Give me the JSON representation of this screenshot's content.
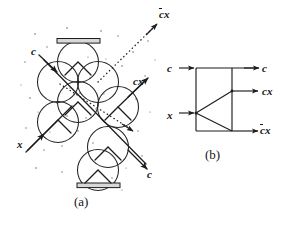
{
  "figure": {
    "background_color": "#ffffff",
    "ink_color": "#141414",
    "panels": [
      {
        "id": "a",
        "caption": "(a)",
        "description": "billiard-ball-model circle lattice with mirrors",
        "labels": {
          "input_c": "c",
          "input_x": "x",
          "output_cbarx": "cx",
          "output_cbarx_overbar": "c",
          "output_cx": "cx",
          "output_c": "c"
        }
      },
      {
        "id": "b",
        "caption": "(b)",
        "description": "interaction gate logic symbol",
        "labels": {
          "input_c": "c",
          "input_x": "x",
          "output_c": "c",
          "output_cx": "cx",
          "output_cbarx_overbar": "c",
          "output_cbarx_rest": "x"
        }
      }
    ]
  },
  "panel_a": {
    "caption": "(a)",
    "label_c_in": "c",
    "label_x_in": "x",
    "label_cbarx_bar": "c",
    "label_cbarx_rest": "x",
    "label_cx": "cx",
    "label_c_out": "c"
  },
  "panel_b": {
    "caption": "(b)",
    "label_c_in": "c",
    "label_x_in": "x",
    "label_c_out": "c",
    "label_cx_out": "cx",
    "label_cbarx_bar": "c",
    "label_cbarx_rest": "x"
  },
  "colors": {
    "ink": "#141414",
    "line": "#2a2a2a",
    "dot": "#555555",
    "mirror_fill": "#d9d9d9",
    "background": "#ffffff"
  },
  "geometry": {
    "circle_radius": 20,
    "circle_centers": [
      [
        78,
        62
      ],
      [
        58,
        82
      ],
      [
        98,
        82
      ],
      [
        78,
        102
      ],
      [
        58,
        122
      ],
      [
        118,
        107
      ],
      [
        108,
        147
      ],
      [
        98,
        170
      ]
    ],
    "mirror_top": {
      "x": 58,
      "y": 40,
      "w": 42,
      "h": 5
    },
    "mirror_bottom": {
      "x": 78,
      "y": 183,
      "w": 42,
      "h": 5
    }
  }
}
